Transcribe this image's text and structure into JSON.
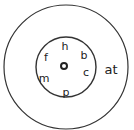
{
  "diagram": {
    "type": "word-family-wheel",
    "outer_circle": {
      "cx": 66,
      "cy": 67,
      "r": 62
    },
    "inner_circle": {
      "cx": 66,
      "cy": 67,
      "r": 30
    },
    "center_dot": {
      "cx": 64,
      "cy": 66,
      "r": 3
    },
    "ending": {
      "text": "at",
      "x": 111,
      "y": 74
    },
    "onsets": [
      {
        "text": "h",
        "x": 65,
        "y": 50
      },
      {
        "text": "b",
        "x": 84,
        "y": 59
      },
      {
        "text": "c",
        "x": 86,
        "y": 76
      },
      {
        "text": "p",
        "x": 66,
        "y": 96
      },
      {
        "text": "m",
        "x": 44,
        "y": 82
      },
      {
        "text": "f",
        "x": 46,
        "y": 61
      }
    ],
    "colors": {
      "stroke": "#333333",
      "text": "#222222",
      "background": "#ffffff"
    }
  }
}
